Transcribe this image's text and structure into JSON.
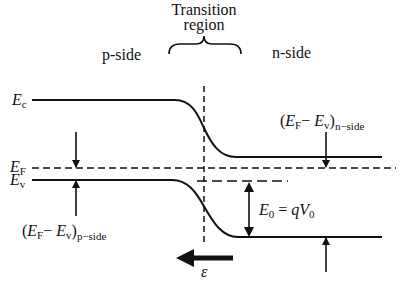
{
  "header": {
    "transition_line1": "Transition",
    "transition_line2": "region",
    "p_side": "p-side",
    "n_side": "n-side"
  },
  "levels": {
    "ec": {
      "symbol": "E",
      "sub": "c"
    },
    "ef": {
      "symbol": "E",
      "sub": "F"
    },
    "ev": {
      "symbol": "E",
      "sub": "v"
    }
  },
  "annotations": {
    "n_side_gap": {
      "open": "(",
      "ef": "E",
      "ef_sub": "F",
      "minus": "− ",
      "ev": "E",
      "ev_sub": "v",
      "close": ")",
      "side": "n−side"
    },
    "p_side_gap": {
      "open": "(",
      "ef": "E",
      "ef_sub": "F",
      "minus": "− ",
      "ev": "E",
      "ev_sub": "v",
      "close": ")",
      "side": "p−side"
    },
    "barrier": {
      "e": "E",
      "e_sub": "0",
      "eq": " = ",
      "q": "qV",
      "v_sub": "0"
    },
    "field": {
      "symbol": "ε"
    }
  },
  "colors": {
    "line": "#111111",
    "background": "#ffffff"
  }
}
